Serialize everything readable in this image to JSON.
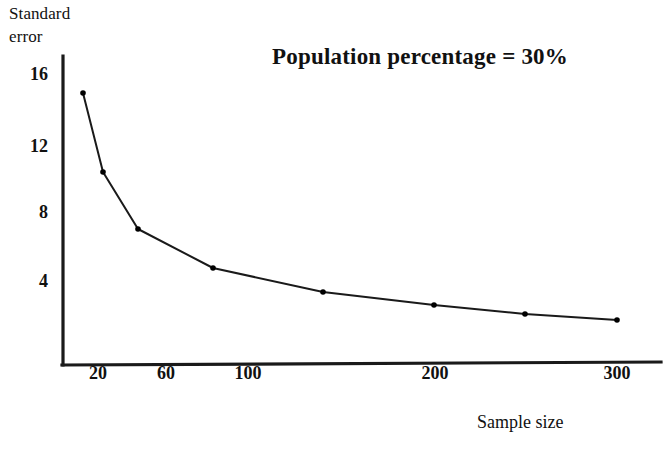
{
  "chart_data": {
    "type": "line",
    "title": "Population percentage = 30%",
    "xlabel": "Sample size",
    "ylabel_line1": "Standard",
    "ylabel_line2": "error",
    "grid": false,
    "legend": "none",
    "xlim": [
      0,
      323
    ],
    "ylim": [
      0,
      17.4
    ],
    "xticks": [
      20,
      60,
      100,
      200,
      300
    ],
    "xticklabels": [
      "20",
      "60",
      "100",
      "200",
      "300"
    ],
    "yticks": [
      4,
      8,
      12,
      16
    ],
    "yticklabels": [
      "4",
      "8",
      "12",
      "16"
    ],
    "x": [
      15,
      25,
      40,
      81,
      140,
      200,
      250,
      300
    ],
    "y": [
      14.9,
      10.2,
      7.0,
      5.1,
      3.9,
      3.4,
      3.0,
      2.7
    ],
    "marker": "dot",
    "line_color": "#1a1a1a",
    "marker_color": "#000000"
  },
  "axes": {
    "origin_px": {
      "x": 63,
      "y": 365
    },
    "y_axis_top_px": 56,
    "x_axis_right_px": 661,
    "ytick_px": {
      "16": 75,
      "12": 147,
      "8": 213,
      "4": 282
    },
    "xtick_px": {
      "20": 98,
      "60": 166,
      "100": 248,
      "200": 435,
      "300": 617
    },
    "point_px": [
      {
        "x": 83,
        "y": 93
      },
      {
        "x": 103,
        "y": 172
      },
      {
        "x": 138,
        "y": 229
      },
      {
        "x": 213,
        "y": 268
      },
      {
        "x": 323,
        "y": 292
      },
      {
        "x": 434,
        "y": 305
      },
      {
        "x": 525,
        "y": 314
      },
      {
        "x": 617,
        "y": 320
      }
    ]
  }
}
